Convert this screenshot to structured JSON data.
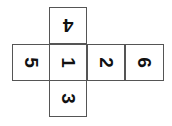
{
  "diagram": {
    "type": "cube-net",
    "faces": [
      {
        "id": "top",
        "label": "4",
        "rotation_deg": 180,
        "col": 1,
        "row": 0
      },
      {
        "id": "left",
        "label": "5",
        "rotation_deg": 90,
        "col": 0,
        "row": 1
      },
      {
        "id": "center",
        "label": "1",
        "rotation_deg": 90,
        "col": 1,
        "row": 1
      },
      {
        "id": "right",
        "label": "2",
        "rotation_deg": 90,
        "col": 2,
        "row": 1
      },
      {
        "id": "far-right",
        "label": "6",
        "rotation_deg": 90,
        "col": 3,
        "row": 1
      },
      {
        "id": "bottom",
        "label": "3",
        "rotation_deg": 90,
        "col": 1,
        "row": 2
      }
    ],
    "colors": {
      "border": "#555555",
      "text": "#111111",
      "background": "#ffffff"
    }
  }
}
